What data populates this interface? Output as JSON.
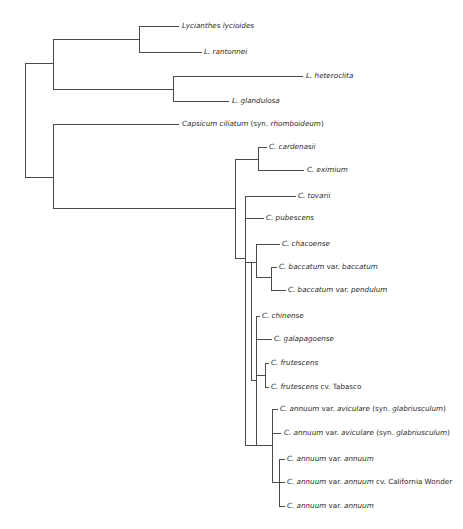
{
  "diagram": {
    "type": "phylogenetic-tree",
    "line_color": "#4a4a4a",
    "text_color": "#2a2a2a",
    "taxa": [
      {
        "id": "lycianthes-lycioides",
        "parts": [
          {
            "t": "Lycianthes lycioides",
            "i": true
          }
        ],
        "x": 182,
        "y": 26
      },
      {
        "id": "l-rantonnei",
        "parts": [
          {
            "t": "L. rantonnei",
            "i": true
          }
        ],
        "x": 204,
        "y": 52
      },
      {
        "id": "l-heteroclita",
        "parts": [
          {
            "t": "L. heteroclita",
            "i": true
          }
        ],
        "x": 306,
        "y": 76
      },
      {
        "id": "l-glandulosa",
        "parts": [
          {
            "t": "L. glandulosa",
            "i": true
          }
        ],
        "x": 232,
        "y": 101
      },
      {
        "id": "capsicum-ciliatum",
        "parts": [
          {
            "t": "Capsicum ciliatum",
            "i": true
          },
          {
            "t": " (syn. ",
            "i": false
          },
          {
            "t": "rhomboideum",
            "i": true
          },
          {
            "t": ")",
            "i": false
          }
        ],
        "x": 182,
        "y": 124
      },
      {
        "id": "c-cardenasii",
        "parts": [
          {
            "t": "C. cardenasii",
            "i": true
          }
        ],
        "x": 269,
        "y": 147
      },
      {
        "id": "c-eximium",
        "parts": [
          {
            "t": "C. eximium",
            "i": true
          }
        ],
        "x": 307,
        "y": 170
      },
      {
        "id": "c-tovarii",
        "parts": [
          {
            "t": "C. tovarii",
            "i": true
          }
        ],
        "x": 298,
        "y": 196
      },
      {
        "id": "c-pubescens",
        "parts": [
          {
            "t": "C. pubescens",
            "i": true
          }
        ],
        "x": 266,
        "y": 218
      },
      {
        "id": "c-chacoense",
        "parts": [
          {
            "t": "C. chacoense",
            "i": true
          }
        ],
        "x": 282,
        "y": 244
      },
      {
        "id": "c-baccatum-baccatum",
        "parts": [
          {
            "t": "C. baccatum",
            "i": true
          },
          {
            "t": " var. ",
            "i": false
          },
          {
            "t": "baccatum",
            "i": true
          }
        ],
        "x": 279,
        "y": 267
      },
      {
        "id": "c-baccatum-pendulum",
        "parts": [
          {
            "t": "C. baccatum",
            "i": true
          },
          {
            "t": " var. ",
            "i": false
          },
          {
            "t": "pendulum",
            "i": true
          }
        ],
        "x": 288,
        "y": 290
      },
      {
        "id": "c-chinense",
        "parts": [
          {
            "t": "C. chinense",
            "i": true
          }
        ],
        "x": 262,
        "y": 316
      },
      {
        "id": "c-galapagoense",
        "parts": [
          {
            "t": "C. galapagoense",
            "i": true
          }
        ],
        "x": 274,
        "y": 339
      },
      {
        "id": "c-frutescens",
        "parts": [
          {
            "t": "C. frutescens",
            "i": true
          }
        ],
        "x": 271,
        "y": 363
      },
      {
        "id": "c-frutescens-tabasco",
        "parts": [
          {
            "t": "C. frutescens",
            "i": true
          },
          {
            "t": " cv. Tabasco",
            "i": false
          }
        ],
        "x": 271,
        "y": 387
      },
      {
        "id": "c-annuum-aviculare-1",
        "parts": [
          {
            "t": "C. annuum",
            "i": true
          },
          {
            "t": " var. ",
            "i": false
          },
          {
            "t": "aviculare",
            "i": true
          },
          {
            "t": " (syn. ",
            "i": false
          },
          {
            "t": "glabriusculum",
            "i": true
          },
          {
            "t": ")",
            "i": false
          }
        ],
        "x": 280,
        "y": 409
      },
      {
        "id": "c-annuum-aviculare-2",
        "parts": [
          {
            "t": "C. annuum",
            "i": true
          },
          {
            "t": " var. ",
            "i": false
          },
          {
            "t": "aviculare",
            "i": true
          },
          {
            "t": " (syn. ",
            "i": false
          },
          {
            "t": "glabriusculum",
            "i": true
          },
          {
            "t": ")",
            "i": false
          }
        ],
        "x": 284,
        "y": 433
      },
      {
        "id": "c-annuum-annuum-1",
        "parts": [
          {
            "t": "C. annuum",
            "i": true
          },
          {
            "t": " var. ",
            "i": false
          },
          {
            "t": "annuum",
            "i": true
          }
        ],
        "x": 287,
        "y": 459
      },
      {
        "id": "c-annuum-california-wonder",
        "parts": [
          {
            "t": "C. annuum",
            "i": true
          },
          {
            "t": " var. ",
            "i": false
          },
          {
            "t": "annuum",
            "i": true
          },
          {
            "t": " cv. California Wonder",
            "i": false
          }
        ],
        "x": 287,
        "y": 482
      },
      {
        "id": "c-annuum-annuum-2",
        "parts": [
          {
            "t": "C. annuum",
            "i": true
          },
          {
            "t": " var. ",
            "i": false
          },
          {
            "t": "annuum",
            "i": true
          }
        ],
        "x": 287,
        "y": 506
      }
    ],
    "segments": [
      [
        25,
        63,
        25,
        177
      ],
      [
        25,
        63,
        53,
        63
      ],
      [
        25,
        177,
        53,
        177
      ],
      [
        53,
        39,
        53,
        89
      ],
      [
        53,
        39,
        139,
        39
      ],
      [
        53,
        89,
        173,
        89
      ],
      [
        139,
        26,
        139,
        52
      ],
      [
        139,
        26,
        178,
        26
      ],
      [
        139,
        52,
        201,
        52
      ],
      [
        173,
        76,
        173,
        101
      ],
      [
        173,
        76,
        302,
        76
      ],
      [
        173,
        101,
        228,
        101
      ],
      [
        53,
        124,
        53,
        208
      ],
      [
        53,
        124,
        178,
        124
      ],
      [
        53,
        208,
        235,
        208
      ],
      [
        235,
        159,
        235,
        258
      ],
      [
        235,
        159,
        258,
        159
      ],
      [
        258,
        147,
        258,
        170
      ],
      [
        258,
        147,
        266,
        147
      ],
      [
        258,
        170,
        303,
        170
      ],
      [
        235,
        258,
        245,
        258
      ],
      [
        245,
        196,
        245,
        445
      ],
      [
        245,
        196,
        295,
        196
      ],
      [
        245,
        218,
        263,
        218
      ],
      [
        245,
        262,
        251,
        262
      ],
      [
        251,
        262,
        251,
        380
      ],
      [
        251,
        262,
        256,
        262
      ],
      [
        256,
        244,
        256,
        277
      ],
      [
        256,
        244,
        279,
        244
      ],
      [
        256,
        277,
        271,
        277
      ],
      [
        271,
        267,
        271,
        290
      ],
      [
        271,
        267,
        276,
        267
      ],
      [
        271,
        290,
        285,
        290
      ],
      [
        251,
        380,
        256,
        380
      ],
      [
        256,
        316,
        256,
        445
      ],
      [
        256,
        316,
        259,
        316
      ],
      [
        256,
        339,
        271,
        339
      ],
      [
        256,
        375,
        265,
        375
      ],
      [
        265,
        363,
        265,
        387
      ],
      [
        265,
        363,
        268,
        363
      ],
      [
        265,
        387,
        268,
        387
      ],
      [
        245,
        445,
        272,
        445
      ],
      [
        272,
        409,
        272,
        482
      ],
      [
        272,
        409,
        277,
        409
      ],
      [
        272,
        433,
        280,
        433
      ],
      [
        272,
        482,
        279,
        482
      ],
      [
        279,
        459,
        279,
        506
      ],
      [
        279,
        459,
        284,
        459
      ],
      [
        279,
        482,
        284,
        482
      ],
      [
        279,
        506,
        284,
        506
      ]
    ]
  }
}
